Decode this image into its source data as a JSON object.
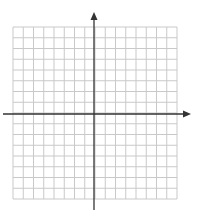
{
  "diagram": {
    "type": "coordinate-plane",
    "grid": {
      "columns": 16,
      "rows": 16,
      "left": 13,
      "top": 27,
      "right": 177,
      "bottom": 199,
      "line_color": "#c9c9c9"
    },
    "x_axis": {
      "y": 114,
      "start_x": 3,
      "end_x": 191,
      "arrow": "right",
      "color": "#333333"
    },
    "y_axis": {
      "x": 94,
      "start_y": 210,
      "end_y": 12,
      "arrow": "up",
      "color": "#333333"
    },
    "labels": []
  }
}
